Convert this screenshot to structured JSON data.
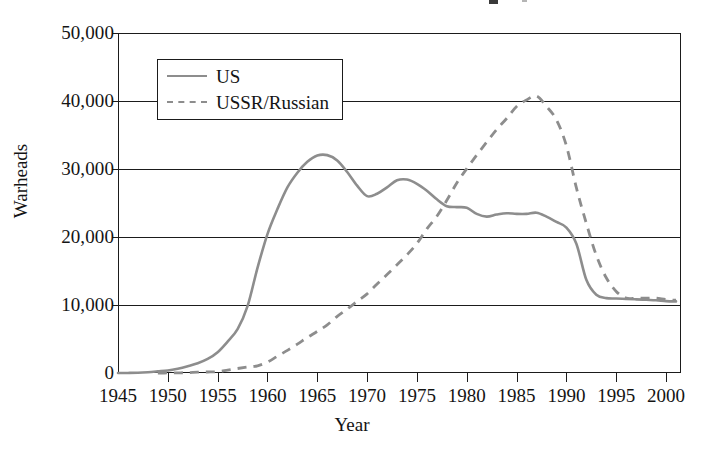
{
  "chart_data": {
    "type": "line",
    "title": "",
    "xlabel": "Year",
    "ylabel": "Warheads",
    "xlim": [
      1945,
      2001.5
    ],
    "ylim": [
      0,
      50000
    ],
    "grid": true,
    "legend_position": "top-left-inside",
    "x_ticks": [
      1945,
      1950,
      1955,
      1960,
      1965,
      1970,
      1975,
      1980,
      1985,
      1990,
      1995,
      2000
    ],
    "x_tick_labels": [
      "1945",
      "1950",
      "1955",
      "1960",
      "1965",
      "1970",
      "1975",
      "1980",
      "1985",
      "1990",
      "1995",
      "2000"
    ],
    "y_ticks": [
      0,
      10000,
      20000,
      30000,
      40000,
      50000
    ],
    "y_tick_labels": [
      "0",
      "10,000",
      "20,000",
      "30,000",
      "40,000",
      "50,000"
    ],
    "series": [
      {
        "name": "US",
        "style": "solid",
        "color": "#8d8d8d",
        "x": [
          1945,
          1946,
          1947,
          1948,
          1949,
          1950,
          1951,
          1952,
          1953,
          1954,
          1955,
          1956,
          1957,
          1958,
          1959,
          1960,
          1961,
          1962,
          1963,
          1964,
          1965,
          1966,
          1967,
          1968,
          1969,
          1970,
          1971,
          1972,
          1973,
          1974,
          1975,
          1976,
          1977,
          1978,
          1979,
          1980,
          1981,
          1982,
          1983,
          1984,
          1985,
          1986,
          1987,
          1988,
          1989,
          1990,
          1991,
          1992,
          1993,
          1994,
          1995,
          1996,
          1997,
          1998,
          1999,
          2000,
          2001
        ],
        "y": [
          6,
          11,
          32,
          110,
          235,
          369,
          640,
          1005,
          1436,
          2063,
          3057,
          4618,
          6444,
          9822,
          15468,
          20434,
          24111,
          27297,
          29459,
          31056,
          31982,
          32040,
          31255,
          29561,
          27552,
          26008,
          26365,
          27296,
          28335,
          28450,
          27826,
          26800,
          25542,
          24530,
          24400,
          24300,
          23400,
          23000,
          23300,
          23500,
          23400,
          23400,
          23575,
          23000,
          22217,
          21392,
          19008,
          13708,
          11511,
          11012,
          10953,
          10886,
          10829,
          10763,
          10698,
          10577,
          10526
        ]
      },
      {
        "name": "USSR/Russian",
        "style": "dashed",
        "color": "#8d8d8d",
        "x": [
          1949,
          1950,
          1951,
          1952,
          1953,
          1954,
          1955,
          1956,
          1957,
          1958,
          1959,
          1960,
          1961,
          1962,
          1963,
          1964,
          1965,
          1966,
          1967,
          1968,
          1969,
          1970,
          1971,
          1972,
          1973,
          1974,
          1975,
          1976,
          1977,
          1978,
          1979,
          1980,
          1981,
          1982,
          1983,
          1984,
          1985,
          1986,
          1987,
          1988,
          1989,
          1990,
          1991,
          1992,
          1993,
          1994,
          1995,
          1996,
          1997,
          1998,
          1999,
          2000,
          2001
        ],
        "y": [
          1,
          5,
          25,
          50,
          120,
          150,
          200,
          426,
          660,
          869,
          1060,
          1605,
          2471,
          3322,
          4238,
          5221,
          6129,
          7089,
          8339,
          9399,
          10538,
          11643,
          13092,
          14478,
          15915,
          17385,
          19055,
          21205,
          23044,
          25393,
          27935,
          30062,
          32049,
          33952,
          35804,
          37431,
          39197,
          40159,
          40723,
          39197,
          37223,
          33417,
          27250,
          22000,
          17300,
          14000,
          12000,
          11000,
          11000,
          11000,
          11000,
          10800,
          10700
        ]
      }
    ],
    "annotations": []
  },
  "legend": {
    "items": [
      {
        "label": "US",
        "style": "solid"
      },
      {
        "label": "USSR/Russian",
        "style": "dashed"
      }
    ]
  },
  "axes": {
    "y_title": "Warheads",
    "x_title": "Year",
    "y_labels": [
      "50,000",
      "40,000",
      "30,000",
      "20,000",
      "10,000",
      "0"
    ],
    "x_labels": [
      "1945",
      "1950",
      "1955",
      "1960",
      "1965",
      "1970",
      "1975",
      "1980",
      "1985",
      "1990",
      "1995",
      "2000"
    ]
  },
  "colors": {
    "series_gray": "#8d8d8d",
    "axis_black": "#1b1b1b",
    "background": "#ffffff"
  }
}
